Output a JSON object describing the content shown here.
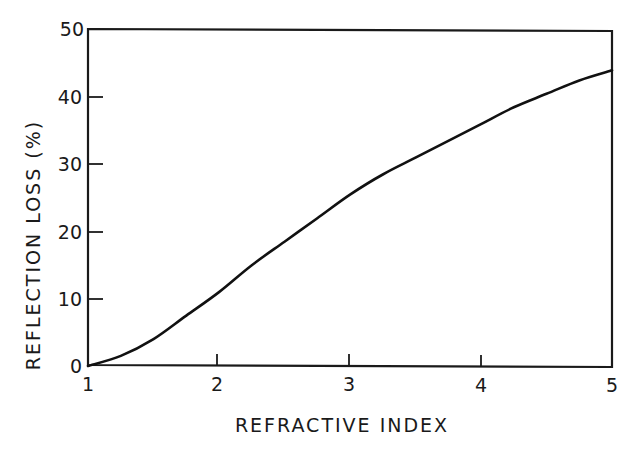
{
  "chart_data": {
    "type": "line",
    "title": "",
    "xlabel": "REFRACTIVE INDEX",
    "ylabel": "REFLECTION LOSS (%)",
    "xlim": [
      1,
      5
    ],
    "ylim": [
      0,
      50
    ],
    "x_ticks": [
      "1",
      "2",
      "3",
      "4",
      "5"
    ],
    "y_ticks": [
      "0",
      "10",
      "20",
      "30",
      "40",
      "50"
    ],
    "grid": false,
    "legend": null,
    "series": [
      {
        "name": "Reflection loss",
        "x": [
          1.0,
          1.25,
          1.5,
          1.75,
          2.0,
          2.25,
          2.5,
          2.75,
          3.0,
          3.25,
          3.5,
          3.75,
          4.0,
          4.25,
          4.5,
          4.75,
          5.0
        ],
        "values": [
          0,
          1.5,
          4,
          7.5,
          11,
          15,
          18.5,
          22,
          25.5,
          28.5,
          31,
          33.5,
          36,
          38.5,
          40.5,
          42.5,
          44
        ]
      }
    ]
  },
  "labels": {
    "xlabel": "REFRACTIVE INDEX",
    "ylabel": "REFLECTION LOSS (%)",
    "x_ticks": [
      "1",
      "2",
      "3",
      "4",
      "5"
    ],
    "y_ticks": [
      "0",
      "10",
      "20",
      "30",
      "40",
      "50"
    ]
  }
}
